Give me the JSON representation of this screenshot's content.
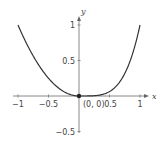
{
  "chart_data": {
    "type": "line",
    "title": "",
    "xlabel": "x",
    "ylabel": "y",
    "xlim": [
      -1.1,
      1.1
    ],
    "ylim": [
      -0.55,
      1.1
    ],
    "grid": false,
    "x_ticks": [
      {
        "value": -1,
        "label": "−1"
      },
      {
        "value": -0.5,
        "label": "−0.5"
      },
      {
        "value": 0.5,
        "label": "0.5"
      },
      {
        "value": 1,
        "label": "1"
      }
    ],
    "y_ticks": [
      {
        "value": -0.5,
        "label": "−0.5"
      },
      {
        "value": 0.5,
        "label": "0.5"
      },
      {
        "value": 1,
        "label": "1"
      }
    ],
    "series": [
      {
        "name": "f(x)",
        "description": "piecewise: x^2 for x<0, x^4 for x>=0",
        "x": [
          -1,
          -0.9,
          -0.8,
          -0.7,
          -0.6,
          -0.5,
          -0.4,
          -0.3,
          -0.2,
          -0.1,
          0,
          0.1,
          0.2,
          0.3,
          0.4,
          0.5,
          0.6,
          0.7,
          0.8,
          0.9,
          1
        ],
        "y": [
          1,
          0.81,
          0.64,
          0.49,
          0.36,
          0.25,
          0.16,
          0.09,
          0.04,
          0.01,
          0,
          0.0001,
          0.0016,
          0.0081,
          0.0256,
          0.0625,
          0.1296,
          0.2401,
          0.4096,
          0.6561,
          1
        ]
      }
    ],
    "annotations": [
      {
        "point": [
          0,
          0
        ],
        "label": "(0, 0)",
        "marker": "filled-dot"
      }
    ]
  },
  "colors": {
    "curve": "#333333",
    "axis": "#888888",
    "dot": "#222222",
    "text": "#444444"
  }
}
